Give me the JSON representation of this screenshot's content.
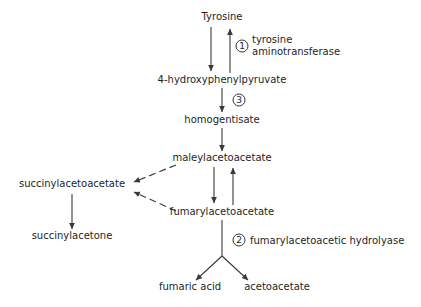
{
  "diagram": {
    "type": "biochemical-pathway",
    "background_color": "#ffffff",
    "line_color": "#3a3a3a",
    "text_color": "#221f1f",
    "metabolites": [
      {
        "id": "tyrosine",
        "label": "Tyrosine",
        "x": 222,
        "y": 20
      },
      {
        "id": "hpp",
        "label": "4-hydroxyphenylpyruvate",
        "x": 222,
        "y": 83
      },
      {
        "id": "homogentisate",
        "label": "homogentisate",
        "x": 222,
        "y": 123
      },
      {
        "id": "maleylacetoacetate",
        "label": "maleylacetoacetate",
        "x": 222,
        "y": 161
      },
      {
        "id": "succinylacetoacetate",
        "label": "succinylacetoacetate",
        "x": 72,
        "y": 187
      },
      {
        "id": "fumarylacetoacetate",
        "label": "fumarylacetoacetate",
        "x": 222,
        "y": 215
      },
      {
        "id": "succinylacetone",
        "label": "succinylacetone",
        "x": 72,
        "y": 239
      },
      {
        "id": "fumaric_acid",
        "label": "fumaric acid",
        "x": 190,
        "y": 290
      },
      {
        "id": "acetoacetate",
        "label": "acetoacetate",
        "x": 277,
        "y": 290
      }
    ],
    "enzymes": [
      {
        "id": "enzyme-1",
        "number": "1",
        "lines": [
          "tyrosine",
          "aminotransferase"
        ],
        "circle_x": 242,
        "circle_y": 46,
        "text_x": 252,
        "text_y": 43
      },
      {
        "id": "enzyme-3",
        "number": "3",
        "lines": [],
        "circle_x": 239,
        "circle_y": 100,
        "text_x": 0,
        "text_y": 0
      },
      {
        "id": "enzyme-2",
        "number": "2",
        "lines": [
          "fumarylacetoacetic hydrolyase"
        ],
        "circle_x": 239,
        "circle_y": 240,
        "text_x": 250,
        "text_y": 243
      }
    ],
    "reactions": [
      {
        "id": "tyr-to-hpp",
        "from": "tyrosine",
        "to": "hpp",
        "style": "solid",
        "direction": "down"
      },
      {
        "id": "hpp-to-tyr",
        "from": "hpp",
        "to": "tyrosine",
        "style": "solid",
        "direction": "up"
      },
      {
        "id": "hpp-to-homogentisate",
        "from": "hpp",
        "to": "homogentisate",
        "style": "solid",
        "direction": "down"
      },
      {
        "id": "homogentisate-to-maleyl",
        "from": "homogentisate",
        "to": "maleylacetoacetate",
        "style": "solid",
        "direction": "down"
      },
      {
        "id": "maleyl-to-fumaryl",
        "from": "maleylacetoacetate",
        "to": "fumarylacetoacetate",
        "style": "solid",
        "direction": "down"
      },
      {
        "id": "fumaryl-to-maleyl",
        "from": "fumarylacetoacetate",
        "to": "maleylacetoacetate",
        "style": "solid",
        "direction": "up"
      },
      {
        "id": "maleyl-to-succinyl",
        "from": "maleylacetoacetate",
        "to": "succinylacetoacetate",
        "style": "dashed",
        "direction": "left"
      },
      {
        "id": "fumaryl-to-succinyl",
        "from": "fumarylacetoacetate",
        "to": "succinylacetoacetate",
        "style": "dashed",
        "direction": "left"
      },
      {
        "id": "succinyl-to-succinylacetone",
        "from": "succinylacetoacetate",
        "to": "succinylacetone",
        "style": "solid",
        "direction": "down"
      },
      {
        "id": "fumaryl-to-fumaric",
        "from": "fumarylacetoacetate",
        "to": "fumaric_acid",
        "style": "solid",
        "direction": "down-left"
      },
      {
        "id": "fumaryl-to-acetoacetate",
        "from": "fumarylacetoacetate",
        "to": "acetoacetate",
        "style": "solid",
        "direction": "down-right"
      }
    ]
  }
}
